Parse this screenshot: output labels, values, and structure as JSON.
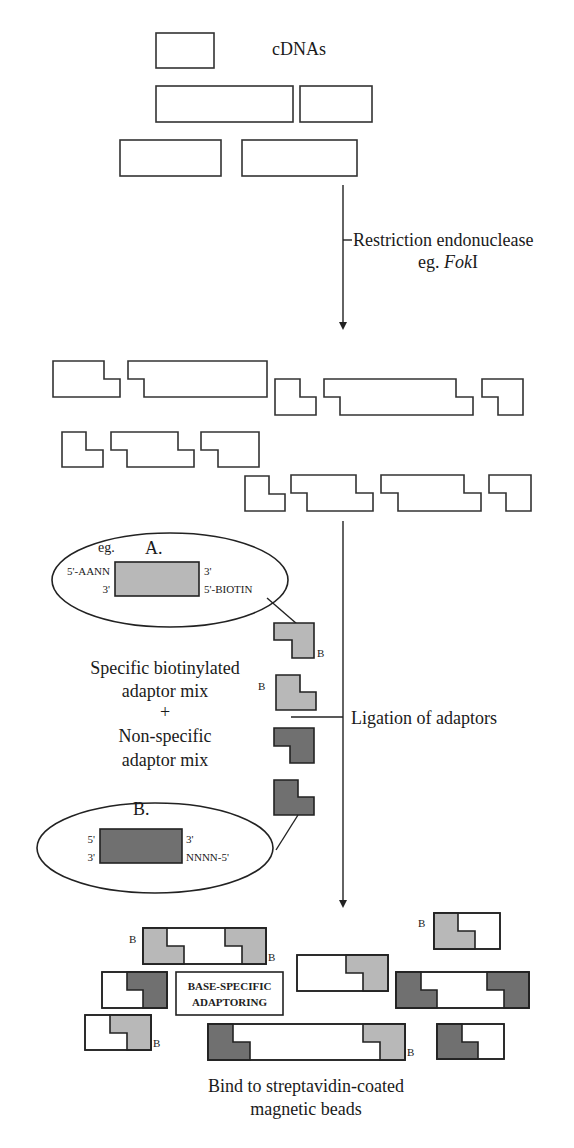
{
  "diagram": {
    "colors": {
      "outline": "#333333",
      "light_adaptor": "#b8b8b8",
      "dark_adaptor": "#707070",
      "background": "#ffffff"
    },
    "stage1": {
      "label": "cDNAs"
    },
    "step1": {
      "line1": "Restriction endonuclease",
      "line2_prefix": "eg. ",
      "line2_enzyme_italic": "Fok",
      "line2_suffix": "I"
    },
    "adaptor_a": {
      "eg": "eg.",
      "label": "A.",
      "left_top": "5'-AANN",
      "left_bottom": "3'",
      "right_top": "3'",
      "right_bottom": "5'-BIOTIN"
    },
    "adaptor_b": {
      "label": "B.",
      "left_top": "5'",
      "left_bottom": "3'",
      "right_top": "3'",
      "right_bottom": "NNNN-5'"
    },
    "mix_text": {
      "line1": "Specific biotinylated",
      "line2": "adaptor mix",
      "line3": "+",
      "line4": "Non-specific",
      "line5": "adaptor mix"
    },
    "step2": {
      "label": "Ligation of adaptors"
    },
    "biotin_marker": "B",
    "result_box": {
      "line1": "BASE-SPECIFIC",
      "line2": "ADAPTORING"
    },
    "final_step": {
      "line1": "Bind to streptavidin-coated",
      "line2": "magnetic beads"
    }
  }
}
